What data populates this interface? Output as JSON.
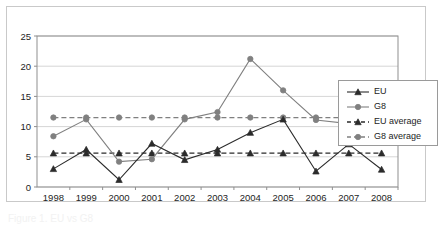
{
  "figure": {
    "caption_fragment": "Figure 1. EU vs G8",
    "frame_color": "#c9c9c9"
  },
  "legend": {
    "position": "right-middle",
    "entries": [
      {
        "label": "EU",
        "marker": "triangle",
        "color": "#2b2b2b",
        "dashed": false
      },
      {
        "label": "G8",
        "marker": "circle",
        "color": "#808080",
        "dashed": false
      },
      {
        "label": "EU average",
        "marker": "triangle",
        "color": "#2b2b2b",
        "dashed": true
      },
      {
        "label": "G8 average",
        "marker": "circle",
        "color": "#808080",
        "dashed": true
      }
    ]
  },
  "axes": {
    "y_ticks": [
      "0",
      "5",
      "10",
      "15",
      "20",
      "25"
    ],
    "x_ticks": [
      "1998",
      "1999",
      "2000",
      "2001",
      "2002",
      "2003",
      "2004",
      "2005",
      "2006",
      "2007",
      "2008"
    ]
  },
  "chart_data": {
    "type": "line",
    "title": "",
    "xlabel": "",
    "ylabel": "",
    "ylim": [
      0,
      25
    ],
    "yticks": [
      0,
      5,
      10,
      15,
      20,
      25
    ],
    "grid": true,
    "legend_position": "right",
    "categories": [
      "1998",
      "1999",
      "2000",
      "2001",
      "2002",
      "2003",
      "2004",
      "2005",
      "2006",
      "2007",
      "2008"
    ],
    "series": [
      {
        "name": "EU",
        "color": "#2b2b2b",
        "marker": "triangle",
        "style": "solid",
        "values": [
          3.0,
          6.2,
          1.2,
          7.2,
          4.5,
          6.2,
          9.0,
          11.2,
          2.6,
          7.1,
          2.9
        ]
      },
      {
        "name": "G8",
        "color": "#808080",
        "marker": "circle",
        "style": "solid",
        "values": [
          8.4,
          11.2,
          4.2,
          4.6,
          11.2,
          12.4,
          21.2,
          16.0,
          11.1,
          10.5,
          15.0
        ]
      },
      {
        "name": "EU average",
        "color": "#2b2b2b",
        "marker": "triangle",
        "style": "dashed",
        "values": [
          5.6,
          5.6,
          5.6,
          5.6,
          5.6,
          5.6,
          5.6,
          5.6,
          5.6,
          5.6,
          5.6
        ]
      },
      {
        "name": "G8 average",
        "color": "#808080",
        "marker": "circle",
        "style": "dashed",
        "values": [
          11.5,
          11.5,
          11.5,
          11.5,
          11.5,
          11.5,
          11.5,
          11.5,
          11.5,
          11.5,
          11.5
        ]
      }
    ]
  }
}
